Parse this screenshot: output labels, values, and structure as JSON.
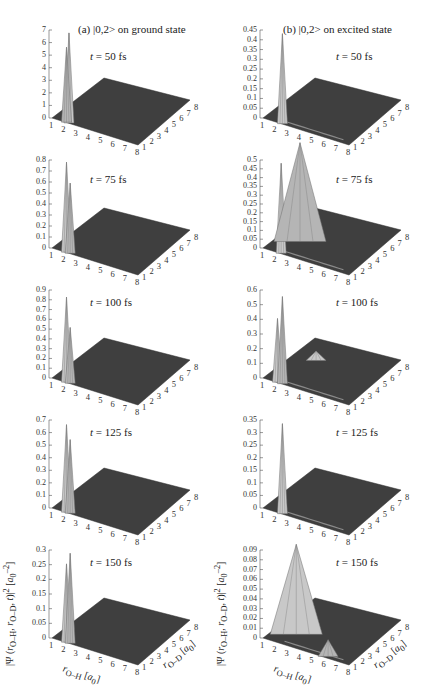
{
  "figure": {
    "column_titles": [
      "(a) |0,2> on ground state",
      "(b) |0,2> on excited state"
    ],
    "zlabel": "|Ψ (r_O–H, r_O–D, t)|² [a₀⁻²]",
    "xlabel": "r_O–H [a₀]",
    "ylabel": "r_O–D [a₀]",
    "x_ticks": [
      "1",
      "2",
      "3",
      "4",
      "5",
      "6",
      "7",
      "8"
    ],
    "y_ticks": [
      "1",
      "2",
      "3",
      "4",
      "5",
      "6",
      "7",
      "8"
    ],
    "colors": {
      "surface_floor": "#3f3f3f",
      "peak_light": "#c8c8c8",
      "peak_dark": "#6e6e6e",
      "axis": "#555555"
    }
  },
  "chart_data": [
    {
      "type": "surface3d",
      "panel": "a",
      "time_label": "t = 50 fs",
      "title": "(a) |0,2> on ground state",
      "zlim": [
        0,
        7
      ],
      "z_ticks": [
        "0",
        "1",
        "2",
        "3",
        "4",
        "5",
        "6",
        "7"
      ],
      "xlabel": "r_O–H [a0]",
      "ylabel": "r_O–D [a0]",
      "xlim": [
        1,
        8
      ],
      "ylim": [
        1,
        8
      ],
      "peaks": [
        {
          "x": 2.2,
          "y": 1.3,
          "z": 7.0
        },
        {
          "x": 2.0,
          "y": 1.3,
          "z": 5.8
        }
      ]
    },
    {
      "type": "surface3d",
      "panel": "b",
      "time_label": "t = 50 fs",
      "title": "(b) |0,2> on excited state",
      "zlim": [
        0,
        0.45
      ],
      "z_ticks": [
        "0",
        "0.05",
        "0.1",
        "0.15",
        "0.2",
        "0.25",
        "0.3",
        "0.35",
        "0.4",
        "0.45"
      ],
      "xlim": [
        1,
        8
      ],
      "ylim": [
        1,
        8
      ],
      "peaks": [
        {
          "x": 2.4,
          "y": 1.3,
          "z": 0.45
        }
      ]
    },
    {
      "type": "surface3d",
      "panel": "a",
      "time_label": "t = 75 fs",
      "zlim": [
        0,
        0.8
      ],
      "z_ticks": [
        "0",
        "0.1",
        "0.2",
        "0.3",
        "0.4",
        "0.5",
        "0.6",
        "0.7",
        "0.8"
      ],
      "xlim": [
        1,
        8
      ],
      "ylim": [
        1,
        8
      ],
      "peaks": [
        {
          "x": 2.0,
          "y": 1.3,
          "z": 0.8
        },
        {
          "x": 2.3,
          "y": 1.3,
          "z": 0.62
        }
      ]
    },
    {
      "type": "surface3d",
      "panel": "b",
      "time_label": "t = 75 fs",
      "zlim": [
        0,
        0.5
      ],
      "z_ticks": [
        "0",
        "0.05",
        "0.1",
        "0.15",
        "0.2",
        "0.25",
        "0.3",
        "0.35",
        "0.4",
        "0.45",
        "0.5"
      ],
      "xlim": [
        1,
        8
      ],
      "ylim": [
        1,
        8
      ],
      "peaks": [
        {
          "x": 2.3,
          "y": 1.3,
          "z": 0.5
        },
        {
          "x": 2.5,
          "y": 3.5,
          "z": 0.55
        }
      ]
    },
    {
      "type": "surface3d",
      "panel": "a",
      "time_label": "t = 100 fs",
      "zlim": [
        0,
        0.9
      ],
      "z_ticks": [
        "0",
        "0.1",
        "0.2",
        "0.3",
        "0.4",
        "0.5",
        "0.6",
        "0.7",
        "0.8",
        "0.9"
      ],
      "xlim": [
        1,
        8
      ],
      "ylim": [
        1,
        8
      ],
      "peaks": [
        {
          "x": 2.0,
          "y": 1.3,
          "z": 0.85
        },
        {
          "x": 2.3,
          "y": 1.3,
          "z": 0.55
        }
      ]
    },
    {
      "type": "surface3d",
      "panel": "b",
      "time_label": "t = 100 fs",
      "zlim": [
        0,
        0.6
      ],
      "z_ticks": [
        "0",
        "0.1",
        "0.2",
        "0.3",
        "0.4",
        "0.5",
        "0.6"
      ],
      "xlim": [
        1,
        8
      ],
      "ylim": [
        1,
        8
      ],
      "peaks": [
        {
          "x": 2.0,
          "y": 1.3,
          "z": 0.42
        },
        {
          "x": 2.4,
          "y": 1.3,
          "z": 0.58
        },
        {
          "x": 2.6,
          "y": 5.5,
          "z": 0.05
        }
      ]
    },
    {
      "type": "surface3d",
      "panel": "a",
      "time_label": "t = 125 fs",
      "zlim": [
        0,
        0.7
      ],
      "z_ticks": [
        "0",
        "0.1",
        "0.2",
        "0.3",
        "0.4",
        "0.5",
        "0.6",
        "0.7"
      ],
      "xlim": [
        1,
        8
      ],
      "ylim": [
        1,
        8
      ],
      "peaks": [
        {
          "x": 2.0,
          "y": 1.3,
          "z": 0.68
        },
        {
          "x": 2.3,
          "y": 1.3,
          "z": 0.57
        }
      ]
    },
    {
      "type": "surface3d",
      "panel": "b",
      "time_label": "t = 125 fs",
      "zlim": [
        0,
        0.35
      ],
      "z_ticks": [
        "0",
        "0.05",
        "0.1",
        "0.15",
        "0.2",
        "0.25",
        "0.3",
        "0.35"
      ],
      "xlim": [
        1,
        8
      ],
      "ylim": [
        1,
        8
      ],
      "peaks": [
        {
          "x": 2.4,
          "y": 1.3,
          "z": 0.35
        }
      ]
    },
    {
      "type": "surface3d",
      "panel": "a",
      "time_label": "t = 150 fs",
      "zlim": [
        0,
        0.3
      ],
      "z_ticks": [
        "0",
        "0.05",
        "0.1",
        "0.15",
        "0.2",
        "0.25",
        "0.3"
      ],
      "xlim": [
        1,
        8
      ],
      "ylim": [
        1,
        8
      ],
      "peaks": [
        {
          "x": 2.0,
          "y": 1.3,
          "z": 0.26
        },
        {
          "x": 2.3,
          "y": 1.3,
          "z": 0.3
        }
      ]
    },
    {
      "type": "surface3d",
      "panel": "b",
      "time_label": "t = 150 fs",
      "zlim": [
        0,
        0.09
      ],
      "z_ticks": [
        "0",
        "0.01",
        "0.02",
        "0.03",
        "0.04",
        "0.05",
        "0.06",
        "0.07",
        "0.08",
        "0.09"
      ],
      "xlim": [
        1,
        8
      ],
      "ylim": [
        1,
        8
      ],
      "peaks": [
        {
          "x": 2.5,
          "y": 3.0,
          "z": 0.09
        },
        {
          "x": 6.0,
          "y": 1.5,
          "z": 0.015
        }
      ]
    }
  ]
}
